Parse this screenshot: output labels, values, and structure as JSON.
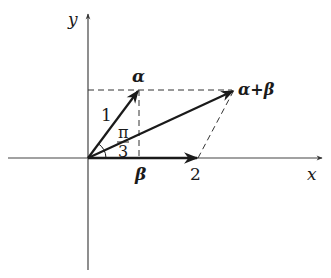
{
  "diagram": {
    "type": "vector-addition",
    "axes": {
      "x_label": "x",
      "y_label": "y"
    },
    "vectors": [
      {
        "name": "alpha",
        "label": "α",
        "magnitude_label": "1"
      },
      {
        "name": "beta",
        "label": "β",
        "magnitude_label": "2"
      },
      {
        "name": "alpha_plus_beta",
        "label": "α+β"
      }
    ],
    "angle": {
      "numerator": "π",
      "denominator": "3"
    },
    "colors": {
      "ink": "#1a1a1a",
      "dash": "#333333"
    }
  }
}
